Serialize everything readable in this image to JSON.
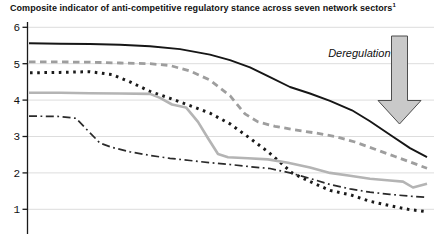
{
  "colors": {
    "background": "#ffffff",
    "text": "#111111",
    "gridline": "#dddddd",
    "axis": "#1a1a1a",
    "arrow_fill": "#c9c9c9",
    "arrow_outline": "#4d4d4d"
  },
  "chart_data": {
    "type": "line",
    "title": "Composite indicator of anti-competitive regulatory stance across seven network sectors",
    "title_superscript": "1",
    "xlabel": "",
    "ylabel": "",
    "x_axis_note": "x-axis tick labels not visible (chart cropped at bottom edge)",
    "x_unit": "horizontal pixel position across plot (29 = left edge of lines, 427 = right edge)",
    "ylim_visible": [
      0.3,
      6
    ],
    "y_ticks": [
      6,
      5,
      4,
      3,
      2,
      1
    ],
    "grid": "horizontal gridlines at each y tick",
    "legend": "none",
    "annotation": {
      "text": "Deregulation",
      "shape": "large gray downward arrow at top right"
    },
    "series": [
      {
        "name": "series-1-solid-black",
        "style": "solid",
        "color": "#161616",
        "width": 1.9,
        "points": [
          [
            29,
            5.56
          ],
          [
            60,
            5.55
          ],
          [
            90,
            5.54
          ],
          [
            120,
            5.52
          ],
          [
            150,
            5.48
          ],
          [
            180,
            5.4
          ],
          [
            210,
            5.25
          ],
          [
            230,
            5.1
          ],
          [
            250,
            4.9
          ],
          [
            270,
            4.63
          ],
          [
            290,
            4.36
          ],
          [
            310,
            4.18
          ],
          [
            330,
            3.98
          ],
          [
            352,
            3.72
          ],
          [
            370,
            3.42
          ],
          [
            390,
            3.05
          ],
          [
            410,
            2.68
          ],
          [
            427,
            2.43
          ]
        ]
      },
      {
        "name": "series-2-gray-dashed",
        "style": "dashed",
        "color": "#9e9e9e",
        "width": 2.8,
        "points": [
          [
            29,
            5.05
          ],
          [
            60,
            5.05
          ],
          [
            90,
            5.04
          ],
          [
            120,
            5.02
          ],
          [
            150,
            5.0
          ],
          [
            170,
            4.95
          ],
          [
            190,
            4.8
          ],
          [
            210,
            4.55
          ],
          [
            230,
            4.12
          ],
          [
            245,
            3.62
          ],
          [
            258,
            3.4
          ],
          [
            275,
            3.28
          ],
          [
            295,
            3.18
          ],
          [
            315,
            3.1
          ],
          [
            335,
            3.0
          ],
          [
            355,
            2.85
          ],
          [
            375,
            2.65
          ],
          [
            395,
            2.45
          ],
          [
            410,
            2.3
          ],
          [
            427,
            2.13
          ]
        ]
      },
      {
        "name": "series-3-black-dotted",
        "style": "dotted",
        "color": "#1a1a1a",
        "width": 3,
        "points": [
          [
            30,
            4.75
          ],
          [
            60,
            4.76
          ],
          [
            90,
            4.78
          ],
          [
            112,
            4.7
          ],
          [
            130,
            4.5
          ],
          [
            150,
            4.24
          ],
          [
            170,
            4.05
          ],
          [
            190,
            3.85
          ],
          [
            210,
            3.64
          ],
          [
            230,
            3.35
          ],
          [
            250,
            2.95
          ],
          [
            268,
            2.58
          ],
          [
            280,
            2.3
          ],
          [
            292,
            2.0
          ],
          [
            310,
            1.76
          ],
          [
            330,
            1.52
          ],
          [
            350,
            1.4
          ],
          [
            370,
            1.22
          ],
          [
            390,
            1.1
          ],
          [
            408,
            1.0
          ],
          [
            425,
            0.94
          ]
        ]
      },
      {
        "name": "series-4-gray-solid",
        "style": "solid",
        "color": "#b4b4b4",
        "width": 2.6,
        "points": [
          [
            29,
            4.2
          ],
          [
            60,
            4.2
          ],
          [
            90,
            4.19
          ],
          [
            120,
            4.18
          ],
          [
            150,
            4.17
          ],
          [
            160,
            4.06
          ],
          [
            172,
            3.88
          ],
          [
            186,
            3.8
          ],
          [
            198,
            3.4
          ],
          [
            208,
            2.95
          ],
          [
            218,
            2.52
          ],
          [
            228,
            2.43
          ],
          [
            248,
            2.4
          ],
          [
            268,
            2.37
          ],
          [
            288,
            2.28
          ],
          [
            310,
            2.15
          ],
          [
            330,
            2.0
          ],
          [
            350,
            1.92
          ],
          [
            370,
            1.84
          ],
          [
            390,
            1.79
          ],
          [
            403,
            1.76
          ],
          [
            413,
            1.6
          ],
          [
            427,
            1.7
          ]
        ]
      },
      {
        "name": "series-5-black-dashdot",
        "style": "dashdot",
        "color": "#2a2a2a",
        "width": 1.7,
        "points": [
          [
            29,
            3.56
          ],
          [
            60,
            3.55
          ],
          [
            76,
            3.5
          ],
          [
            90,
            3.1
          ],
          [
            100,
            2.82
          ],
          [
            112,
            2.7
          ],
          [
            130,
            2.58
          ],
          [
            150,
            2.48
          ],
          [
            170,
            2.4
          ],
          [
            190,
            2.34
          ],
          [
            210,
            2.28
          ],
          [
            230,
            2.23
          ],
          [
            250,
            2.17
          ],
          [
            270,
            2.12
          ],
          [
            290,
            2.0
          ],
          [
            310,
            1.85
          ],
          [
            330,
            1.68
          ],
          [
            350,
            1.56
          ],
          [
            370,
            1.47
          ],
          [
            390,
            1.41
          ],
          [
            410,
            1.36
          ],
          [
            427,
            1.33
          ]
        ]
      }
    ]
  }
}
